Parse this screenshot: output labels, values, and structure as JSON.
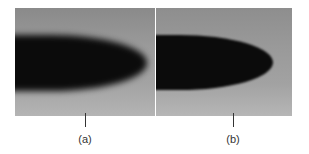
{
  "figure": {
    "panels": [
      {
        "id": "a",
        "label": "(a)",
        "description": "blurred dark elliptical tip on gray gradient background"
      },
      {
        "id": "b",
        "label": "(b)",
        "description": "sharper dark elliptical tip on gray gradient background"
      }
    ],
    "colors": {
      "background": "#ffffff",
      "panel_gray": "#9a9a9a",
      "blob": "#0b0b0b",
      "label_text": "#333333"
    }
  }
}
